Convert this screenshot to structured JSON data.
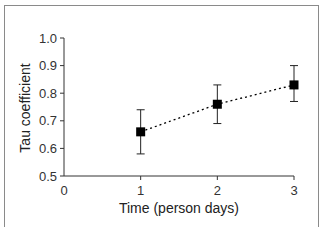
{
  "chart_data": {
    "type": "line",
    "title": "",
    "xlabel": "Time (person days)",
    "ylabel": "Tau coefficient",
    "xlim": [
      0,
      3
    ],
    "ylim": [
      0.5,
      1.0
    ],
    "x_ticks": [
      "0",
      "1",
      "2",
      "3"
    ],
    "y_ticks": [
      "0.5",
      "0.6",
      "0.7",
      "0.8",
      "0.9",
      "1.0"
    ],
    "grid": false,
    "legend": null,
    "series": [
      {
        "name": "Tau coefficient",
        "marker": "square",
        "line_style": "dotted",
        "color": "#000000",
        "x": [
          1,
          2,
          3
        ],
        "values": [
          0.66,
          0.76,
          0.83
        ],
        "error_upper": [
          0.74,
          0.83,
          0.9
        ],
        "error_lower": [
          0.58,
          0.69,
          0.77
        ]
      }
    ]
  }
}
